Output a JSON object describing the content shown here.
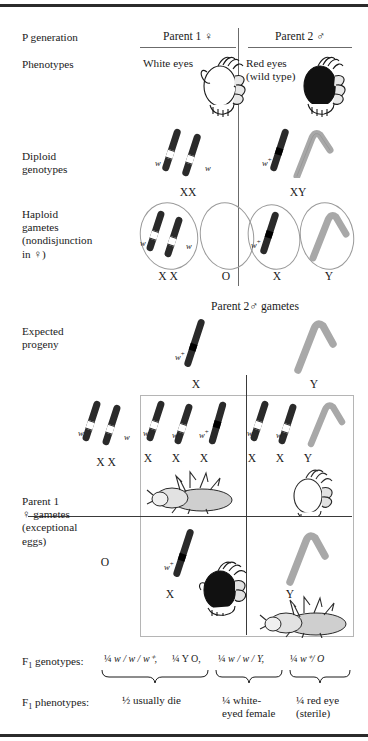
{
  "figure": {
    "row_labels": {
      "p_generation": "P generation",
      "phenotypes": "Phenotypes",
      "diploid_genotypes": "Diploid\ngenotypes",
      "haploid_gametes": "Haploid\ngametes\n(nondisjunction\nin ♀)",
      "expected_progeny": "Expected\nprogeny",
      "parent1_gametes": "Parent 1\n♀ gametes\n(exceptional\neggs)",
      "f1_genotypes": "F₁ genotypes:",
      "f1_phenotypes": "F₁ phenotypes:"
    },
    "parents": [
      {
        "id": "parent1",
        "header": "Parent 1 ♀",
        "phenotype": "White eyes",
        "eye_color": "white",
        "diploid_label": "XX",
        "allele_labels": [
          "w",
          "w"
        ]
      },
      {
        "id": "parent2",
        "header": "Parent 2 ♂",
        "phenotype": "Red eyes\n(wild type)",
        "eye_color": "red",
        "diploid_label": "XY",
        "allele_labels": [
          "w⁺"
        ]
      }
    ],
    "haploid_gametes": {
      "parent1": [
        {
          "label": "X  X",
          "alleles": [
            "w",
            "w"
          ],
          "contents": "two-x"
        },
        {
          "label": "O",
          "alleles": [],
          "contents": "empty"
        }
      ],
      "parent2": [
        {
          "label": "X",
          "alleles": [
            "w⁺"
          ],
          "contents": "one-x-plus"
        },
        {
          "label": "Y",
          "alleles": [],
          "contents": "y"
        }
      ]
    },
    "punnett": {
      "column_header": "Parent 2♂ gametes",
      "columns": [
        {
          "label": "X",
          "allele": "w⁺",
          "type": "x-plus"
        },
        {
          "label": "Y",
          "allele": "",
          "type": "y"
        }
      ],
      "rows": [
        {
          "label": "X  X",
          "alleles": [
            "w",
            "w"
          ],
          "type": "xx"
        },
        {
          "label": "O",
          "alleles": [],
          "type": "o"
        }
      ],
      "cells": [
        {
          "id": "xx-by-x",
          "chromosome_labels": [
            "X",
            "X",
            "X"
          ],
          "alleles": [
            "w",
            "w",
            "w⁺"
          ],
          "outcome": "dead-fly",
          "outcome_text": "usually die"
        },
        {
          "id": "xx-by-y",
          "chromosome_labels": [
            "X",
            "X",
            "Y"
          ],
          "alleles": [
            "w",
            "w",
            ""
          ],
          "outcome": "white-eyed-female",
          "outcome_text": "white-eyed female"
        },
        {
          "id": "o-by-x",
          "chromosome_labels": [
            "X"
          ],
          "alleles": [
            "w⁺"
          ],
          "outcome": "red-eyed-fly",
          "outcome_text": "red eye (sterile)"
        },
        {
          "id": "o-by-y",
          "chromosome_labels": [
            "Y"
          ],
          "alleles": [
            ""
          ],
          "outcome": "dead-fly",
          "outcome_text": "usually die"
        }
      ]
    },
    "f1_genotypes": [
      {
        "fraction": "¼",
        "genotype": "w / w / w⁺,"
      },
      {
        "fraction": "¼",
        "genotype": "Y O,"
      },
      {
        "fraction": "¼",
        "genotype": "w / w / Y,"
      },
      {
        "fraction": "¼",
        "genotype": "w⁺/ O"
      }
    ],
    "f1_phenotypes": [
      {
        "fraction": "½",
        "text": "usually die"
      },
      {
        "fraction": "¼",
        "text": "white-\neyed female"
      },
      {
        "fraction": "¼",
        "text": "red eye\n(sterile)"
      }
    ],
    "colors": {
      "x_chromosome": "#2a2a2a",
      "y_chromosome": "#a8a8a8",
      "band_white": "#ffffff",
      "band_black": "#000000",
      "rule": "#2b2b2b",
      "text": "#1a1a1a",
      "red_eye": "#111111"
    }
  }
}
